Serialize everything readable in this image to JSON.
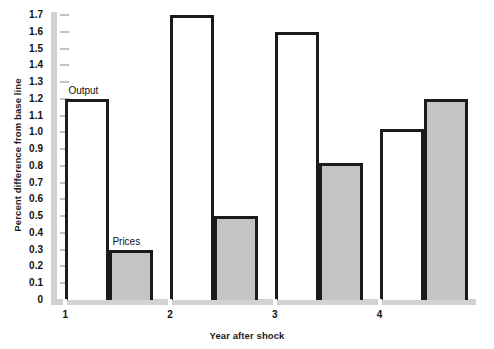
{
  "chart_data": {
    "type": "bar",
    "title": "",
    "subtitle": "",
    "xlabel": "Year after shock",
    "ylabel": "Percent difference from base line",
    "categories": [
      "1",
      "2",
      "3",
      "4"
    ],
    "series": [
      {
        "name": "Output",
        "values": [
          1.2,
          1.7,
          1.6,
          1.02
        ],
        "fill": "#ffffff",
        "stroke": "#1b1b1b"
      },
      {
        "name": "Prices",
        "values": [
          0.3,
          0.5,
          0.82,
          1.2
        ],
        "fill": "#c4c4c4",
        "stroke": "#1b1b1b"
      }
    ],
    "ylim": [
      0,
      1.7
    ],
    "ytick_step": 0.1,
    "ytick_labels": [
      "1.7",
      "1.6",
      "1.5",
      "1.4",
      "1.3",
      "1.2",
      "1.1",
      "1.0",
      "0.9",
      "0.8",
      "0.7",
      "0.6",
      "0.5",
      "0.4",
      "0.3",
      "0.2",
      "0.1",
      "0"
    ],
    "grid": false,
    "legend_position": "inline-annotations",
    "annotations": [
      {
        "text": "Output",
        "series": "Output",
        "category": "1"
      },
      {
        "text": "Prices",
        "series": "Prices",
        "category": "1"
      }
    ],
    "axis_color": "#d2d2d2",
    "tick_color": "#c2c2c2",
    "text_color": "#111111",
    "background": "#ffffff"
  }
}
